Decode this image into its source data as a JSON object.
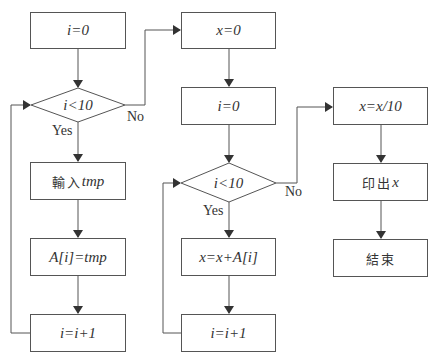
{
  "diagram": {
    "type": "flowchart",
    "nodes": [
      {
        "id": "init_i_1",
        "shape": "process",
        "text": "i=0"
      },
      {
        "id": "cond_1",
        "shape": "decision",
        "text": "i<10"
      },
      {
        "id": "input_tmp",
        "shape": "process",
        "text_cjk": "輸入",
        "text_var": "tmp"
      },
      {
        "id": "assign_a",
        "shape": "process",
        "text": "A[i]=tmp"
      },
      {
        "id": "inc_i_1",
        "shape": "process",
        "text": "i=i+1"
      },
      {
        "id": "init_x",
        "shape": "process",
        "text": "x=0"
      },
      {
        "id": "init_i_2",
        "shape": "process",
        "text": "i=0"
      },
      {
        "id": "cond_2",
        "shape": "decision",
        "text": "i<10"
      },
      {
        "id": "sum_x",
        "shape": "process",
        "text": "x=x+A[i]"
      },
      {
        "id": "inc_i_2",
        "shape": "process",
        "text": "i=i+1"
      },
      {
        "id": "div_x",
        "shape": "process",
        "text": "x=x/10"
      },
      {
        "id": "print_x",
        "shape": "process",
        "text_cjk": "印出",
        "text_var": "x"
      },
      {
        "id": "end",
        "shape": "process",
        "text_cjk": "結束"
      }
    ],
    "edges": [
      {
        "from": "init_i_1",
        "to": "cond_1"
      },
      {
        "from": "cond_1",
        "to": "input_tmp",
        "label": "Yes"
      },
      {
        "from": "cond_1",
        "to": "init_x",
        "label": "No"
      },
      {
        "from": "input_tmp",
        "to": "assign_a"
      },
      {
        "from": "assign_a",
        "to": "inc_i_1"
      },
      {
        "from": "inc_i_1",
        "to": "cond_1"
      },
      {
        "from": "init_x",
        "to": "init_i_2"
      },
      {
        "from": "init_i_2",
        "to": "cond_2"
      },
      {
        "from": "cond_2",
        "to": "sum_x",
        "label": "Yes"
      },
      {
        "from": "cond_2",
        "to": "div_x",
        "label": "No"
      },
      {
        "from": "sum_x",
        "to": "inc_i_2"
      },
      {
        "from": "inc_i_2",
        "to": "cond_2"
      },
      {
        "from": "div_x",
        "to": "print_x"
      },
      {
        "from": "print_x",
        "to": "end"
      }
    ],
    "labels": {
      "yes": "Yes",
      "no": "No"
    },
    "colors": {
      "line": "#555555",
      "text": "#333333",
      "background": "#ffffff"
    }
  }
}
